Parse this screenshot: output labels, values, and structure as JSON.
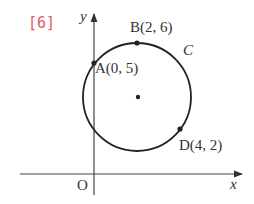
{
  "problem_number": "[6]",
  "axes": {
    "x_label": "x",
    "y_label": "y",
    "origin_label": "O"
  },
  "circle_label": "C",
  "points": [
    {
      "name": "A",
      "label": "A(0, 5)"
    },
    {
      "name": "B",
      "label": "B(2, 6)"
    },
    {
      "name": "D",
      "label": "D(4, 2)"
    }
  ],
  "colors": {
    "number": "#e05a6a",
    "lines": "#333333"
  }
}
